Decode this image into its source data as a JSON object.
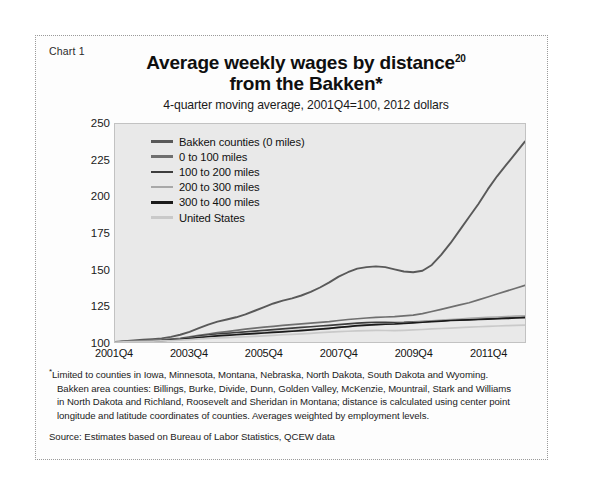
{
  "figure": {
    "chart_label": "Chart 1",
    "title_line1": "Average weekly wages by distance",
    "title_superscript": "20",
    "title_line2": "from the Bakken*",
    "subtitle": "4-quarter moving average, 2001Q4=100, 2012 dollars"
  },
  "notes": {
    "footnote_marker": "*",
    "footnote_line1": "Limited to counties in Iowa, Minnesota, Montana, Nebraska, North Dakota, South Dakota and Wyoming.",
    "footnote_line2": "Bakken area counties: Billings, Burke, Divide, Dunn, Golden Valley, McKenzie, Mountrail, Stark and Williams",
    "footnote_line3": "in North Dakota and Richland, Roosevelt and Sheridan in Montana; distance is calculated using center point",
    "footnote_line4": "longitude and latitude coordinates of counties. Averages weighted by employment levels.",
    "source": "Source: Estimates based on Bureau of Labor Statistics, QCEW data"
  },
  "colors": {
    "plot_background": "#e9e9e9",
    "plot_border": "#c2c2c2",
    "series_bakken": "#595959",
    "series_0_100": "#6f6f6f",
    "series_100_200": "#3d3d3d",
    "series_200_300": "#a8a8a8",
    "series_300_400": "#1a1a1a",
    "series_us": "#c9c9c9"
  },
  "chart_data": {
    "type": "line",
    "subtitle": "4-quarter moving average, 2001Q4=100, 2012 dollars",
    "xlabel": "",
    "ylabel": "",
    "ylim": [
      100,
      250
    ],
    "ytick_values": [
      100,
      125,
      150,
      175,
      200,
      225,
      250
    ],
    "ytick_labels": [
      "100",
      "125",
      "150",
      "175",
      "200",
      "225",
      "250"
    ],
    "xlim": [
      2001.75,
      2012.75
    ],
    "xtick_labels": [
      "2001Q4",
      "2003Q4",
      "2005Q4",
      "2007Q4",
      "2009Q4",
      "2011Q4"
    ],
    "xtick_positions": [
      2001.75,
      2003.75,
      2005.75,
      2007.75,
      2009.75,
      2011.75
    ],
    "grid": false,
    "legend_position": "upper-left inside plot",
    "x": [
      2001.75,
      2002.0,
      2002.25,
      2002.5,
      2002.75,
      2003.0,
      2003.25,
      2003.5,
      2003.75,
      2004.0,
      2004.25,
      2004.5,
      2004.75,
      2005.0,
      2005.25,
      2005.5,
      2005.75,
      2006.0,
      2006.25,
      2006.5,
      2006.75,
      2007.0,
      2007.25,
      2007.5,
      2007.75,
      2008.0,
      2008.25,
      2008.5,
      2008.75,
      2009.0,
      2009.25,
      2009.5,
      2009.75,
      2010.0,
      2010.25,
      2010.5,
      2010.75,
      2011.0,
      2011.25,
      2011.5,
      2011.75,
      2012.0,
      2012.25,
      2012.5,
      2012.75
    ],
    "series": [
      {
        "name": "Bakken counties (0 miles)",
        "color": "#595959",
        "values": [
          100,
          100.5,
          101,
          101.5,
          102,
          102.5,
          103.5,
          105,
          107,
          109.5,
          112,
          114,
          115.5,
          117,
          119,
          121.5,
          124,
          126.5,
          128.5,
          130,
          132,
          134.5,
          137.5,
          141,
          145,
          148,
          150.5,
          151.5,
          152,
          151.5,
          150,
          148.5,
          148,
          149,
          153,
          160,
          168,
          177,
          186,
          195,
          205,
          214,
          222,
          230,
          238
        ]
      },
      {
        "name": "0 to 100 miles",
        "color": "#6f6f6f",
        "values": [
          100,
          100.2,
          100.5,
          100.8,
          101.2,
          101.6,
          102,
          102.5,
          103.5,
          104.5,
          105.5,
          106.5,
          107.2,
          108,
          108.8,
          109.5,
          110.2,
          110.8,
          111.5,
          112,
          112.5,
          113,
          113.5,
          114,
          114.8,
          115.5,
          116,
          116.5,
          117,
          117.2,
          117.5,
          118,
          118.5,
          119.5,
          121,
          122.5,
          124,
          125.5,
          127,
          129,
          131,
          133,
          135,
          137,
          139
        ]
      },
      {
        "name": "100 to 200 miles",
        "color": "#3d3d3d",
        "values": [
          100,
          100.2,
          100.4,
          100.7,
          101,
          101.3,
          101.7,
          102.2,
          103,
          104,
          104.8,
          105.5,
          106,
          106.5,
          107,
          107.5,
          108,
          108.5,
          109,
          109.5,
          110,
          110.5,
          111,
          111.5,
          112,
          112.5,
          113,
          113.3,
          113.6,
          113.5,
          113.4,
          113.5,
          113.8,
          114,
          114.3,
          114.6,
          115,
          115.2,
          115.5,
          115.8,
          116,
          116.3,
          116.6,
          117,
          117.3
        ]
      },
      {
        "name": "200 to 300 miles",
        "color": "#a8a8a8",
        "values": [
          100,
          100.2,
          100.4,
          100.6,
          100.9,
          101.2,
          101.5,
          102,
          102.6,
          103.3,
          104,
          104.6,
          105,
          105.4,
          105.8,
          106.2,
          106.6,
          107,
          107.4,
          107.8,
          108.2,
          108.6,
          109,
          109.4,
          110,
          110.5,
          111,
          111.5,
          112,
          112.2,
          112.5,
          113,
          113.5,
          114,
          114.5,
          115,
          115.4,
          115.8,
          116.2,
          116.6,
          117,
          117.2,
          117.5,
          117.8,
          118
        ]
      },
      {
        "name": "300 to 400 miles",
        "color": "#1a1a1a",
        "values": [
          100,
          100.1,
          100.3,
          100.5,
          100.8,
          101,
          101.4,
          101.8,
          102.4,
          103,
          103.6,
          104.2,
          104.6,
          105,
          105.4,
          105.8,
          106.2,
          106.6,
          107,
          107.4,
          107.8,
          108.3,
          108.8,
          109.4,
          110,
          110.6,
          111.2,
          111.6,
          112,
          112.2,
          112.4,
          112.8,
          113.2,
          113.6,
          114,
          114.4,
          114.8,
          115,
          115.2,
          115.5,
          115.8,
          116,
          116.2,
          116.5,
          116.8
        ]
      },
      {
        "name": "United States",
        "color": "#c9c9c9",
        "values": [
          100,
          100.1,
          100.2,
          100.4,
          100.6,
          100.8,
          101,
          101.3,
          101.7,
          102.1,
          102.5,
          102.8,
          103,
          103.3,
          103.6,
          103.9,
          104.2,
          104.6,
          105,
          105.3,
          105.6,
          106,
          106.4,
          106.8,
          107.2,
          107.4,
          107.6,
          107.8,
          108,
          107.9,
          107.8,
          108,
          108.3,
          108.6,
          109,
          109.3,
          109.6,
          109.9,
          110.2,
          110.5,
          110.8,
          111,
          111.2,
          111.4,
          111.6
        ]
      }
    ]
  }
}
